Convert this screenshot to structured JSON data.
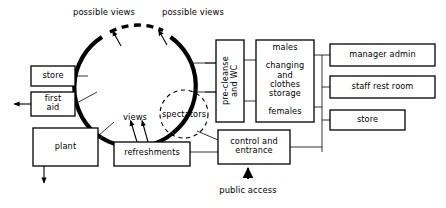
{
  "diagram": {
    "line_color": "#000000",
    "background_color": "#ffffff",
    "boxes": [
      {
        "id": "store-left",
        "label": "store",
        "x": 31,
        "y": 66,
        "w": 44,
        "h": 20
      },
      {
        "id": "first-aid",
        "label": "first\naid",
        "x": 31,
        "y": 92,
        "w": 44,
        "h": 24
      },
      {
        "id": "plant",
        "label": "plant",
        "x": 33,
        "y": 128,
        "w": 65,
        "h": 38
      },
      {
        "id": "refreshments",
        "label": "refreshments",
        "x": 114,
        "y": 142,
        "w": 76,
        "h": 24
      },
      {
        "id": "pre-cleanse-wc",
        "label": "pre-cleanse\nand WC",
        "x": 216,
        "y": 40,
        "w": 28,
        "h": 82
      },
      {
        "id": "changing",
        "label": "males\n\nchanging\nand\nclothes\nstorage\n\nfemales",
        "x": 256,
        "y": 40,
        "w": 58,
        "h": 82
      },
      {
        "id": "control-entrance",
        "label": "control and\nentrance",
        "x": 218,
        "y": 130,
        "w": 72,
        "h": 34
      },
      {
        "id": "manager-admin",
        "label": "manager admin",
        "x": 330,
        "y": 44,
        "w": 105,
        "h": 22
      },
      {
        "id": "staff-rest-room",
        "label": "staff rest room",
        "x": 330,
        "y": 76,
        "w": 105,
        "h": 22
      },
      {
        "id": "store-right",
        "label": "store",
        "x": 330,
        "y": 110,
        "w": 75,
        "h": 20
      }
    ],
    "circles": [
      {
        "id": "main-arena",
        "label": "",
        "cx": 136,
        "cy": 87,
        "r": 60,
        "style": "solid-thick"
      },
      {
        "id": "spectators",
        "label": "spectators",
        "cx": 184,
        "cy": 114,
        "r": 24,
        "style": "dashed"
      }
    ],
    "free_labels": [
      {
        "id": "possible-views-left",
        "text": "possible views",
        "x": 59,
        "y": 8,
        "w": 90,
        "align": "center"
      },
      {
        "id": "possible-views-right",
        "text": "possible views",
        "x": 148,
        "y": 8,
        "w": 90,
        "align": "center"
      },
      {
        "id": "views",
        "text": "views",
        "x": 117,
        "y": 113,
        "w": 36,
        "align": "center"
      },
      {
        "id": "public-access",
        "text": "public access",
        "x": 210,
        "y": 186,
        "w": 90,
        "align": "center"
      }
    ],
    "arrows": [
      {
        "id": "possible-views-arrow-left",
        "from": "arena-top-left",
        "to": "possible-views-left"
      },
      {
        "id": "possible-views-arrow-right",
        "from": "arena-top-right",
        "to": "possible-views-right"
      },
      {
        "id": "views-arrow-left",
        "from": "refreshments",
        "to": "arena-bottom-a"
      },
      {
        "id": "views-arrow-right",
        "from": "refreshments",
        "to": "arena-bottom-b"
      },
      {
        "id": "first-aid-exit-arrow",
        "from": "first-aid",
        "to": "outside-left"
      },
      {
        "id": "plant-exit-arrow",
        "from": "plant",
        "to": "outside-bottom"
      },
      {
        "id": "public-access-arrow",
        "from": "public-access",
        "to": "control-entrance"
      }
    ],
    "connections": [
      {
        "id": "store-left-to-arena",
        "from": "store-left",
        "to": "main-arena"
      },
      {
        "id": "first-aid-to-arena",
        "from": "first-aid",
        "to": "main-arena"
      },
      {
        "id": "plant-to-arena",
        "from": "plant",
        "to": "main-arena"
      },
      {
        "id": "arena-to-pre-cleanse-upper",
        "from": "main-arena",
        "to": "pre-cleanse-wc"
      },
      {
        "id": "arena-to-pre-cleanse-lower",
        "from": "main-arena",
        "to": "pre-cleanse-wc"
      },
      {
        "id": "spectators-to-control",
        "from": "spectators",
        "to": "control-entrance"
      },
      {
        "id": "pre-cleanse-to-changing-top",
        "from": "pre-cleanse-wc",
        "to": "changing"
      },
      {
        "id": "pre-cleanse-to-changing-bot",
        "from": "pre-cleanse-wc",
        "to": "changing"
      },
      {
        "id": "changing-to-manager-admin",
        "from": "changing",
        "to": "manager-admin"
      },
      {
        "id": "changing-to-staff-rest-room",
        "from": "changing",
        "to": "staff-rest-room"
      },
      {
        "id": "changing-to-store-right",
        "from": "changing",
        "to": "store-right"
      },
      {
        "id": "control-to-right-trunk",
        "from": "control-entrance",
        "to": "store-right"
      },
      {
        "id": "refreshments-to-control",
        "from": "refreshments",
        "to": "control-entrance"
      },
      {
        "id": "control-to-pre-cleanse",
        "from": "control-entrance",
        "to": "pre-cleanse-wc"
      }
    ]
  }
}
